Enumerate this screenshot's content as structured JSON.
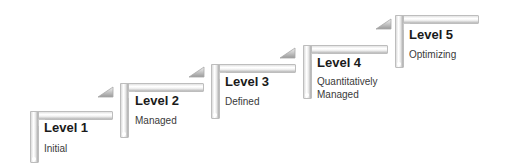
{
  "diagram": {
    "type": "staircase",
    "steps": [
      {
        "title": "Level 1",
        "description": "Initial",
        "has_arrow": true
      },
      {
        "title": "Level 2",
        "description": "Managed",
        "has_arrow": true
      },
      {
        "title": "Level 3",
        "description": "Defined",
        "has_arrow": true
      },
      {
        "title": "Level 4",
        "description": "Quantitatively\nManaged",
        "description_lines": [
          "Quantitatively",
          "Managed"
        ],
        "has_arrow": true
      },
      {
        "title": "Level 5",
        "description": "Optimizing",
        "has_arrow": false
      }
    ]
  },
  "colors": {
    "bar_light": "#ffffff",
    "bar_dark": "#b9b9b9",
    "border": "#bdbdbd",
    "text_title": "#1a1a1a",
    "text_desc": "#3a3a3a"
  }
}
